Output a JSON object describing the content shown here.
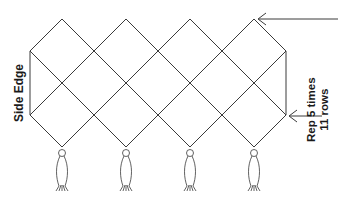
{
  "diagram": {
    "type": "knotting/netting pattern",
    "labels": {
      "side_edge": "Side Edge",
      "repeat_line1": "Rep 5 times",
      "repeat_line2": "11 rows"
    },
    "lattice": {
      "columns": 4,
      "peaks_x": [
        62,
        126,
        190,
        254
      ],
      "top_y": 19,
      "bottom_y": 150,
      "left_edge_x": 30,
      "right_edge_x": 286,
      "edge_span_y": [
        52,
        118
      ]
    },
    "tassels": {
      "count": 4
    },
    "arrows": [
      {
        "name": "repeat-start-arrow",
        "from_x": 340,
        "to_x": 258,
        "y": 19
      },
      {
        "name": "repeat-end-arrow",
        "from_x": 330,
        "to_x": 290,
        "y": 118
      }
    ],
    "colors": {
      "line": "#3a3a3a",
      "text": "#1a1a1a",
      "background": "#ffffff"
    }
  }
}
